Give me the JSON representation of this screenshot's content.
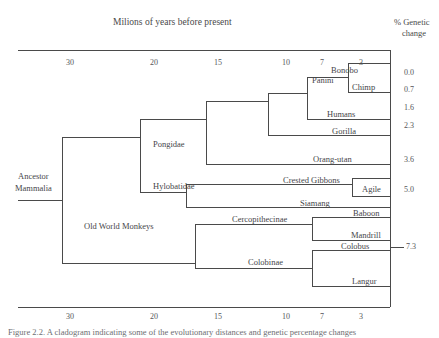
{
  "figure": {
    "axis_title": "Milions of years before present",
    "right_header_line1": "% Genetic",
    "right_header_line2": "change",
    "caption": "Figure 2.2. A cladogram indicating some of the evolutionary distances and genetic percentage changes",
    "line_color": "#4a4a4a",
    "text_color": "#46464a"
  },
  "time_axis": {
    "ticks": [
      "30",
      "20",
      "15",
      "10",
      "7",
      "3"
    ],
    "tick_x": [
      72,
      155,
      219,
      287,
      322,
      362
    ],
    "top_y": 50,
    "bottom_y": 307,
    "label_top_y": 59,
    "label_bottom_y": 311
  },
  "genetic_change": {
    "values": [
      "0.0",
      "0.7",
      "1.6",
      "2.3",
      "3.6",
      "5.0",
      "7.3"
    ],
    "y": [
      73,
      90,
      108,
      126,
      160,
      190,
      240
    ]
  },
  "nodes": [
    {
      "name": "Ancestor Mammalia",
      "line1": "Ancestor",
      "line2": "Mammalia",
      "x": 18,
      "y": 178
    },
    {
      "name": "Pongidae",
      "label": "Pongidae",
      "x": 155,
      "y": 141
    },
    {
      "name": "Hylobatidae",
      "label": "Hylobatidae",
      "x": 155,
      "y": 183
    },
    {
      "name": "Old World Monkeys",
      "label": "Old World Monkeys",
      "x": 84,
      "y": 223
    },
    {
      "name": "Panini",
      "label": "Panini",
      "x": 313,
      "y": 84
    },
    {
      "name": "Cercopithecinae",
      "label": "Cercopithecinae",
      "x": 232,
      "y": 216
    },
    {
      "name": "Colobinae",
      "label": "Colobinae",
      "x": 248,
      "y": 258
    }
  ],
  "taxa": [
    {
      "name": "Bonobo",
      "label": "Bonobo",
      "x": 333,
      "y": 68
    },
    {
      "name": "Chimp",
      "label": "Chimp",
      "x": 351,
      "y": 85
    },
    {
      "name": "Humans",
      "label": "Humans",
      "x": 328,
      "y": 112
    },
    {
      "name": "Gorilla",
      "label": "Gorilla",
      "x": 331,
      "y": 129
    },
    {
      "name": "Orang-utan",
      "label": "Orang-utan",
      "x": 316,
      "y": 156
    },
    {
      "name": "Crested Gibbons",
      "label": "Crested Gibbons",
      "x": 283,
      "y": 177
    },
    {
      "name": "Agile",
      "label": "Agile",
      "x": 362,
      "y": 187
    },
    {
      "name": "Siamang",
      "label": "Siamang",
      "x": 299,
      "y": 200
    },
    {
      "name": "Baboon",
      "label": "Baboon",
      "x": 355,
      "y": 210
    },
    {
      "name": "Mandrill",
      "label": "Mandrill",
      "x": 352,
      "y": 231
    },
    {
      "name": "Colobus",
      "label": "Colobus",
      "x": 341,
      "y": 243
    },
    {
      "name": "Langur",
      "label": "Langur",
      "x": 352,
      "y": 276
    }
  ]
}
